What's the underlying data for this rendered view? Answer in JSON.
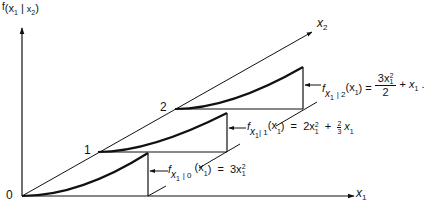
{
  "figure": {
    "y_axis_label": {
      "f": "f",
      "paren_open": "(",
      "x1": "x",
      "x1_sub": "1",
      "bar": "|",
      "x2": "x",
      "x2_sub": "2",
      "paren_close": ")"
    },
    "x1_axis_label": {
      "x": "x",
      "sub": "1"
    },
    "x2_axis_label": {
      "x": "x",
      "sub": "2"
    },
    "level_labels": [
      "0",
      "1",
      "2"
    ],
    "curves": [
      {
        "level": "0",
        "lhs_f": "f",
        "lhs_sub": "x",
        "lhs_sub_sub": "1",
        "lhs_cond": "| 0",
        "lhs_arg": "(x",
        "lhs_arg_sub": "1",
        "lhs_arg_close": ")",
        "equals": "=",
        "rhs": "3x",
        "rhs_sup": "2",
        "rhs_sub": "1"
      },
      {
        "level": "1",
        "lhs_f": "f",
        "lhs_sub": "x",
        "lhs_sub_sub": "1",
        "lhs_cond": "| 1",
        "lhs_arg": "(x",
        "lhs_arg_sub": "1",
        "lhs_arg_close": ")",
        "equals": "=",
        "rhs_term1": "2x",
        "rhs_term1_sup": "2",
        "rhs_term1_sub": "1",
        "plus": "+",
        "frac_num": "2",
        "frac_den": "3",
        "rhs_term2": "x",
        "rhs_term2_sub": "1"
      },
      {
        "level": "2",
        "lhs_f": "f",
        "lhs_sub": "x",
        "lhs_sub_sub": "1",
        "lhs_cond": "| 2",
        "lhs_arg": "(x",
        "lhs_arg_sub": "1",
        "lhs_arg_close": ")",
        "equals": "=",
        "frac_num": "3x",
        "frac_num_sup": "2",
        "frac_num_sub": "1",
        "frac_den": "2",
        "plus": "+",
        "rhs_term2": "x",
        "rhs_term2_sub": "1",
        "period": "."
      }
    ]
  }
}
